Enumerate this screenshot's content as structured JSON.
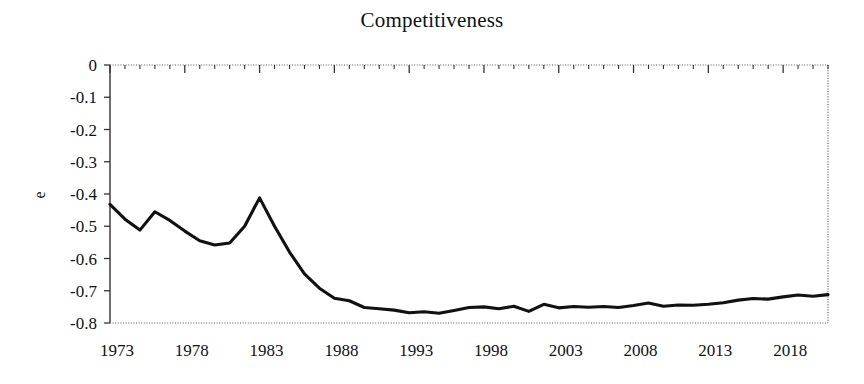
{
  "chart_data": {
    "type": "line",
    "title": "Competitiveness",
    "xlabel": "",
    "ylabel": "e",
    "xlim": [
      1973,
      2021
    ],
    "ylim": [
      -0.8,
      0
    ],
    "grid": false,
    "legend": "none",
    "y_ticks": [
      0,
      -0.1,
      -0.2,
      -0.3,
      -0.4,
      -0.5,
      -0.6,
      -0.7,
      -0.8
    ],
    "y_tick_labels": [
      "0",
      "-0.1",
      "-0.2",
      "-0.3",
      "-0.4",
      "-0.5",
      "-0.6",
      "-0.7",
      "-0.8"
    ],
    "x_ticks": [
      1973,
      1978,
      1983,
      1988,
      1993,
      1998,
      2003,
      2008,
      2013,
      2018
    ],
    "x_tick_labels": [
      "1973",
      "1978",
      "1983",
      "1988",
      "1993",
      "1998",
      "2003",
      "2008",
      "2013",
      "2018"
    ],
    "x_minor_tick_step": 1,
    "line_color": "#111111",
    "series": [
      {
        "name": "e",
        "x": [
          1973,
          1974,
          1975,
          1976,
          1977,
          1978,
          1979,
          1980,
          1981,
          1982,
          1983,
          1984,
          1985,
          1986,
          1987,
          1988,
          1989,
          1990,
          1991,
          1992,
          1993,
          1994,
          1995,
          1996,
          1997,
          1998,
          1999,
          2000,
          2001,
          2002,
          2003,
          2004,
          2005,
          2006,
          2007,
          2008,
          2009,
          2010,
          2011,
          2012,
          2013,
          2014,
          2015,
          2016,
          2017,
          2018,
          2019,
          2020,
          2021
        ],
        "values": [
          -0.432,
          -0.478,
          -0.512,
          -0.455,
          -0.482,
          -0.515,
          -0.545,
          -0.558,
          -0.552,
          -0.5,
          -0.412,
          -0.5,
          -0.58,
          -0.648,
          -0.692,
          -0.723,
          -0.731,
          -0.752,
          -0.756,
          -0.76,
          -0.768,
          -0.765,
          -0.77,
          -0.761,
          -0.752,
          -0.75,
          -0.756,
          -0.748,
          -0.764,
          -0.742,
          -0.753,
          -0.749,
          -0.751,
          -0.749,
          -0.752,
          -0.746,
          -0.738,
          -0.748,
          -0.744,
          -0.745,
          -0.742,
          -0.737,
          -0.729,
          -0.724,
          -0.726,
          -0.719,
          -0.713,
          -0.717,
          -0.712
        ]
      }
    ]
  },
  "axes": {
    "title": "Competitiveness",
    "y_axis_title": "e"
  }
}
